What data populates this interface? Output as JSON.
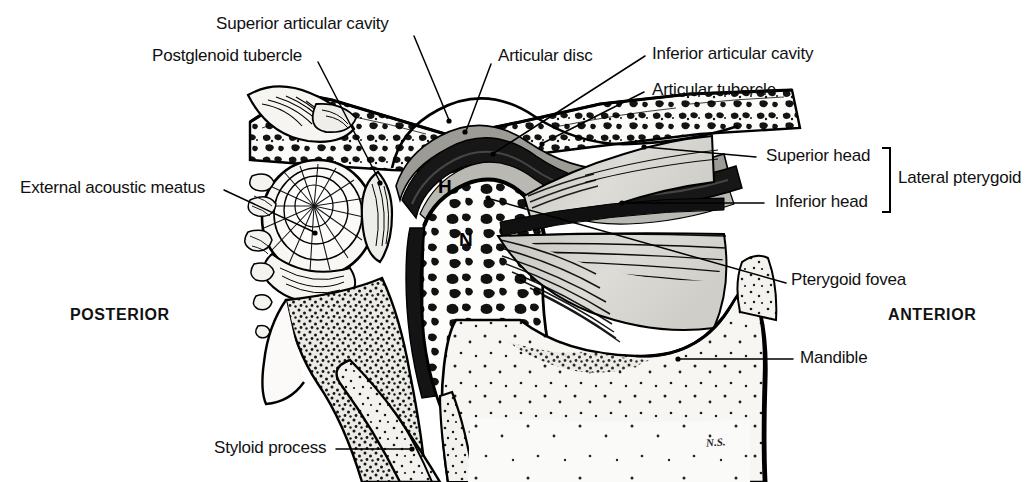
{
  "figure": {
    "signature": "N.S.",
    "background_color": "#ffffff",
    "ink_color": "#000000",
    "bone_fill": "#f2f1ee",
    "cartilage_fill": "#8d8d88",
    "disc_fill": "#1a1a1a",
    "muscle_fill": "#d8d7d2",
    "ramus_fill": "#f4f3f0"
  },
  "labels": {
    "superior_articular_cavity": "Superior articular cavity",
    "postglenoid_tubercle": "Postglenoid tubercle",
    "articular_disc": "Articular disc",
    "inferior_articular_cavity": "Inferior articular cavity",
    "articular_tubercle": "Articular tubercle",
    "superior_head": "Superior head",
    "inferior_head": "Inferior head",
    "lateral_pterygoid": "Lateral pterygoid",
    "external_acoustic_meatus": "External acoustic meatus",
    "pterygoid_fovea": "Pterygoid fovea",
    "mandible": "Mandible",
    "styloid_process": "Styloid process",
    "posterior": "POSTERIOR",
    "anterior": "ANTERIOR",
    "condylar_head": "H",
    "condylar_neck": "N"
  }
}
